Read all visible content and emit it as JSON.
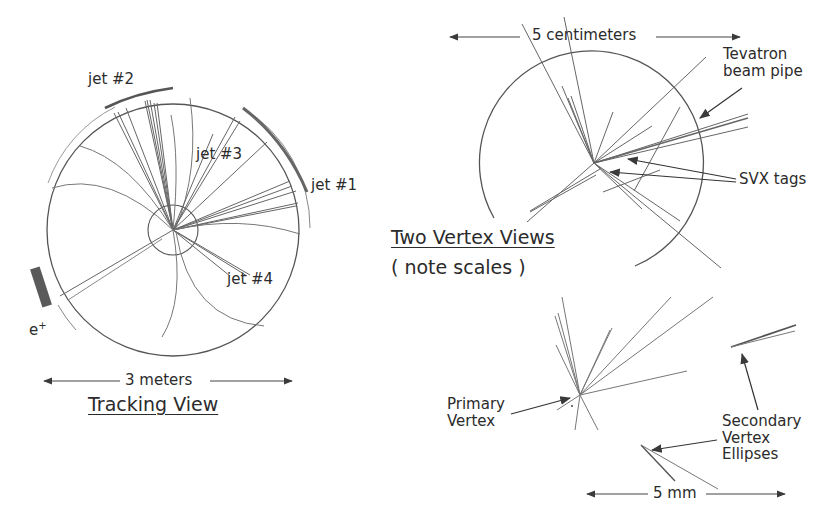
{
  "tracking_view": {
    "title": "Tracking View",
    "scale_label": "3 meters",
    "jets": [
      {
        "label": "jet #1"
      },
      {
        "label": "jet #2"
      },
      {
        "label": "jet #3"
      },
      {
        "label": "jet #4"
      }
    ],
    "positron_label": "e",
    "positron_sup": "+"
  },
  "vertex_views": {
    "title": "Two Vertex Views",
    "subtitle": "( note scales )",
    "upper": {
      "scale_label": "5 centimeters",
      "beam_pipe_label_line1": "Tevatron",
      "beam_pipe_label_line2": "beam pipe",
      "svx_label": "SVX tags"
    },
    "lower": {
      "scale_label": "5 mm",
      "primary_label_line1": "Primary",
      "primary_label_line2": "Vertex",
      "secondary_label_line1": "Secondary",
      "secondary_label_line2": "Vertex",
      "secondary_label_line3": "Ellipses"
    }
  },
  "colors": {
    "line": "#555555",
    "track": "#777777",
    "calorimeter": "#6a6a6a",
    "text": "#2b2b2b",
    "background": "#ffffff"
  }
}
